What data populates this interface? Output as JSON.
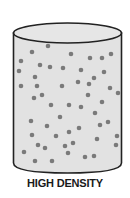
{
  "caption": "HIGH DENSITY",
  "colors": {
    "fill": "#e2e2e2",
    "outline": "#222222",
    "particle": "#7a7a7a"
  },
  "cylinder": {
    "cx": 67.5,
    "top_cy": 33,
    "rx": 54,
    "ry": 10,
    "bottom_y": 168
  },
  "particles": [
    [
      32,
      52
    ],
    [
      48,
      46
    ],
    [
      21,
      61
    ],
    [
      71,
      54
    ],
    [
      90,
      58
    ],
    [
      102,
      58
    ],
    [
      111,
      54
    ],
    [
      19,
      71
    ],
    [
      40,
      65
    ],
    [
      50,
      67
    ],
    [
      63,
      68
    ],
    [
      81,
      70
    ],
    [
      104,
      72
    ],
    [
      35,
      77
    ],
    [
      94,
      78
    ],
    [
      21,
      86
    ],
    [
      37,
      86
    ],
    [
      62,
      86
    ],
    [
      78,
      82
    ],
    [
      89,
      84
    ],
    [
      110,
      88
    ],
    [
      118,
      93
    ],
    [
      42,
      95
    ],
    [
      34,
      98
    ],
    [
      88,
      95
    ],
    [
      51,
      105
    ],
    [
      69,
      105
    ],
    [
      81,
      107
    ],
    [
      102,
      102
    ],
    [
      95,
      113
    ],
    [
      60,
      117
    ],
    [
      31,
      121
    ],
    [
      47,
      126
    ],
    [
      100,
      125
    ],
    [
      108,
      122
    ],
    [
      32,
      135
    ],
    [
      56,
      136
    ],
    [
      69,
      132
    ],
    [
      79,
      128
    ],
    [
      117,
      136
    ],
    [
      97,
      139
    ],
    [
      38,
      145
    ],
    [
      45,
      148
    ],
    [
      65,
      146
    ],
    [
      73,
      143
    ],
    [
      116,
      145
    ],
    [
      24,
      152
    ],
    [
      68,
      153
    ],
    [
      35,
      161
    ],
    [
      52,
      161
    ],
    [
      85,
      157
    ],
    [
      94,
      156
    ]
  ]
}
